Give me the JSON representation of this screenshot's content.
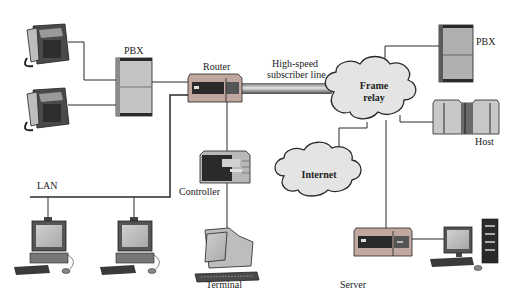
{
  "diagram": {
    "nodes": {
      "phone_top": {
        "label": "",
        "icon": "telephone-icon"
      },
      "phone_bottom": {
        "label": "",
        "icon": "telephone-icon"
      },
      "pbx_left": {
        "label": "PBX",
        "icon": "pbx-cabinet-icon"
      },
      "router": {
        "label": "Router",
        "icon": "router-icon"
      },
      "link_label": {
        "line1": "High-speed",
        "line2": "subscriber line"
      },
      "frame_relay": {
        "line1": "Frame",
        "line2": "relay",
        "icon": "cloud-icon"
      },
      "pbx_right": {
        "label": "PBX",
        "icon": "pbx-cabinet-icon"
      },
      "host": {
        "label": "Host",
        "icon": "mainframe-icon"
      },
      "internet": {
        "label": "Internet",
        "icon": "cloud-icon"
      },
      "controller": {
        "label": "Controller",
        "icon": "controller-box-icon"
      },
      "terminal": {
        "label": "Terminal",
        "icon": "terminal-icon"
      },
      "lan": {
        "label": "LAN"
      },
      "pc_left": {
        "label": "",
        "icon": "desktop-pc-icon"
      },
      "pc_middle": {
        "label": "",
        "icon": "desktop-pc-icon"
      },
      "server": {
        "label": "Server",
        "icon": "server-icon"
      },
      "workstation": {
        "label": "",
        "icon": "tower-workstation-icon"
      }
    },
    "colors": {
      "line": "#2a2a2a",
      "device_body": "#c9c9c9",
      "device_dark": "#3a3a3a",
      "cloud_fill": "#e4e4e4",
      "pipe_dark": "#555555",
      "pipe_light": "#cfcfcf"
    }
  }
}
